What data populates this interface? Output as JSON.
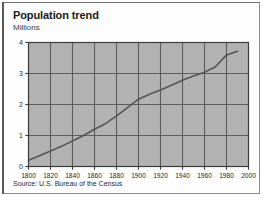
{
  "figure": {
    "title": "Population trend",
    "subtitle": "Millions",
    "source": "Source: U.S. Bureau of the Census"
  },
  "colors": {
    "plot_background": "#b2b2b2",
    "grid_line": "#5c5c5c",
    "axis_line": "#3b3b3b",
    "data_line": "#555555",
    "panel_background": "#fdfdfd",
    "page_background": "#ffffff",
    "frame_border": "#6f6f6f",
    "title_text": "#1a1a1a",
    "body_text": "#2b2b2b"
  },
  "chart_data": {
    "type": "line",
    "title": "Population trend",
    "subtitle": "Millions",
    "xlabel": "",
    "ylabel": "Millions",
    "xlim": [
      1800,
      2000
    ],
    "ylim": [
      0,
      4
    ],
    "xticks": [
      1800,
      1820,
      1840,
      1860,
      1880,
      1900,
      1920,
      1940,
      1960,
      1980,
      2000
    ],
    "xtick_labels": [
      "1800",
      "1820",
      "1840",
      "1860",
      "1880",
      "1900",
      "1920",
      "1940",
      "1960",
      "1980",
      "2000"
    ],
    "yticks": [
      0,
      1,
      2,
      3,
      4
    ],
    "ytick_labels": [
      "0",
      "1",
      "2",
      "3",
      "4"
    ],
    "grid": true,
    "legend": null,
    "source": "Source: U.S. Bureau of the Census",
    "series": [
      {
        "name": "Population",
        "x": [
          1800,
          1810,
          1820,
          1830,
          1840,
          1850,
          1860,
          1870,
          1880,
          1890,
          1900,
          1910,
          1920,
          1930,
          1940,
          1950,
          1960,
          1970,
          1980,
          1990
        ],
        "values": [
          0.2,
          0.35,
          0.5,
          0.65,
          0.82,
          1.0,
          1.2,
          1.38,
          1.63,
          1.9,
          2.17,
          2.33,
          2.47,
          2.62,
          2.78,
          2.92,
          3.04,
          3.22,
          3.6,
          3.72
        ]
      }
    ]
  }
}
